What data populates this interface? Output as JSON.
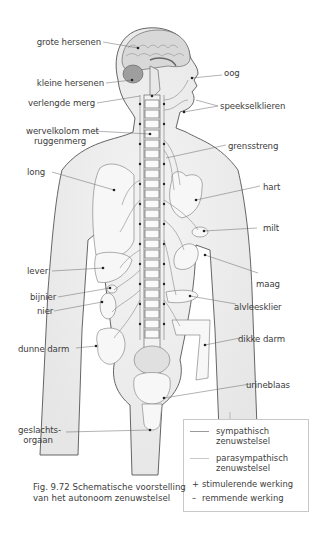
{
  "figure": {
    "caption_line1": "Fig. 9.72  Schematische voorstelling",
    "caption_line2": "van het autonoom zenuwstelsel"
  },
  "labels_left": {
    "grote_hersenen": "grote hersenen",
    "kleine_hersenen": "kleine hersenen",
    "verlengde_merg": "verlengde merg",
    "wervelkolom_1": "wervelkolom met",
    "wervelkolom_2": "ruggenmerg",
    "long": "long",
    "lever": "lever",
    "bijnier": "bijnier",
    "nier": "nier",
    "dunne_darm": "dunne darm",
    "geslachtsorgaan_1": "geslachts-",
    "geslachtsorgaan_2": "orgaan"
  },
  "labels_right": {
    "oog": "oog",
    "speekselklieren": "speekselklieren",
    "grensstreng": "grensstreng",
    "hart": "hart",
    "milt": "milt",
    "maag": "maag",
    "alvleesklier": "alvleesklier",
    "dikke_darm": "dikke darm",
    "urineblaas": "urineblaas"
  },
  "legend": {
    "items": [
      {
        "symbol": "line",
        "color": "#9a9a9a",
        "text1": "sympathisch",
        "text2": "zenuwstelsel"
      },
      {
        "symbol": "line",
        "color": "#c8c8c8",
        "text1": "parasympathisch",
        "text2": "zenuwstelsel"
      },
      {
        "symbol": "+",
        "text1": "stimulerende werking"
      },
      {
        "symbol": "–",
        "text1": "remmende werking"
      }
    ]
  },
  "colors": {
    "outline": "#555555",
    "body_fill": "#ececec",
    "organ_fill": "#f6f6f6",
    "leader": "#666666",
    "dot": "#222222"
  }
}
